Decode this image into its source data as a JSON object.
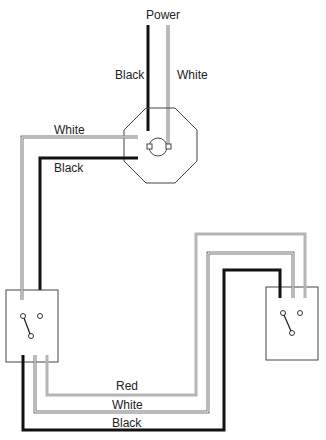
{
  "diagram": {
    "labels": {
      "power": "Power",
      "power_black": "Black",
      "power_white": "White",
      "fixture_white": "White",
      "fixture_black": "Black",
      "bottom_red": "Red",
      "bottom_white": "White",
      "bottom_black": "Black"
    },
    "colors": {
      "black_wire": "#111111",
      "white_wire": "#8a8a8a",
      "red_wire": "#b5b5b5",
      "outline": "#444444"
    },
    "components": [
      "power-source",
      "light-fixture-box",
      "switch-left",
      "switch-right"
    ]
  }
}
